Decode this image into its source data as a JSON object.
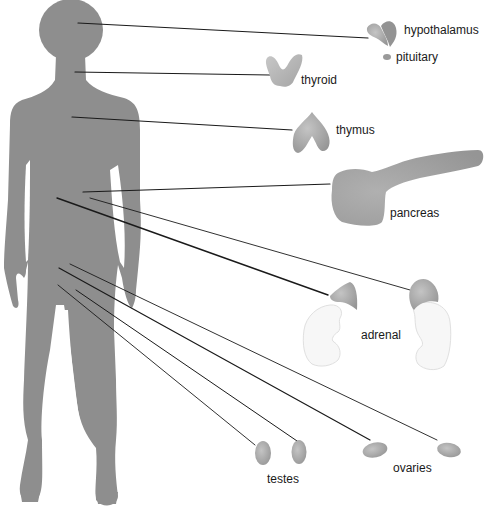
{
  "diagram": {
    "title": "",
    "colors": {
      "silhouette": "#8e8e8e",
      "gland": "#a9a9a9",
      "gland_dark": "#8f8f8f",
      "kidney": "#f7f7f7",
      "line": "#1a1a1a",
      "text": "#1a1a1a"
    },
    "labels": {
      "hypothalamus": "hypothalamus",
      "pituitary": "pituitary",
      "thyroid": "thyroid",
      "thymus": "thymus",
      "pancreas": "pancreas",
      "adrenal": "adrenal",
      "testes": "testes",
      "ovaries": "ovaries"
    },
    "glands": [
      {
        "name": "hypothalamus",
        "label_pos": [
          404,
          24
        ]
      },
      {
        "name": "pituitary",
        "label_pos": [
          396,
          50
        ]
      },
      {
        "name": "thyroid",
        "label_pos": [
          301,
          73
        ]
      },
      {
        "name": "thymus",
        "label_pos": [
          336,
          123
        ]
      },
      {
        "name": "pancreas",
        "label_pos": [
          390,
          206
        ]
      },
      {
        "name": "adrenal",
        "label_pos": [
          361,
          328
        ]
      },
      {
        "name": "testes",
        "label_pos": [
          267,
          472
        ]
      },
      {
        "name": "ovaries",
        "label_pos": [
          393,
          461
        ]
      }
    ],
    "leader_lines": [
      {
        "target": "hypothalamus",
        "from": [
          78,
          23
        ],
        "to": [
          368,
          38
        ],
        "width": 1.2
      },
      {
        "target": "thyroid",
        "from": [
          75,
          72
        ],
        "to": [
          270,
          75
        ],
        "width": 1.2
      },
      {
        "target": "thymus",
        "from": [
          72,
          117
        ],
        "to": [
          292,
          130
        ],
        "width": 1.2
      },
      {
        "target": "pancreas",
        "from": [
          83,
          192
        ],
        "to": [
          330,
          184
        ],
        "width": 1.2
      },
      {
        "target": "adrenal-left",
        "from": [
          57,
          198
        ],
        "to": [
          328,
          295
        ],
        "width": 1.4
      },
      {
        "target": "adrenal-right",
        "from": [
          90,
          198
        ],
        "to": [
          410,
          290
        ],
        "width": 0.9
      },
      {
        "target": "ovary-right",
        "from": [
          70,
          264
        ],
        "to": [
          437,
          440
        ],
        "width": 0.9
      },
      {
        "target": "ovary-left",
        "from": [
          59,
          268
        ],
        "to": [
          370,
          440
        ],
        "width": 1.2
      },
      {
        "target": "testis-right",
        "from": [
          76,
          290
        ],
        "to": [
          300,
          443
        ],
        "width": 1.0
      },
      {
        "target": "testis-left",
        "from": [
          58,
          285
        ],
        "to": [
          255,
          445
        ],
        "width": 0.9
      }
    ]
  }
}
